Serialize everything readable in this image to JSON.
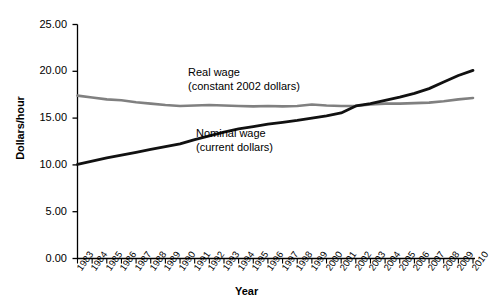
{
  "chart_data": {
    "type": "line",
    "title": "",
    "xlabel": "Year",
    "ylabel": "Dollars/hour",
    "xlim": [
      1983,
      2010
    ],
    "ylim": [
      0,
      25
    ],
    "grid": false,
    "legend_position": "inline-annotations",
    "ytick_labels": [
      "25.00",
      "20.00",
      "15.00",
      "10.00",
      "5.00",
      "0.00"
    ],
    "ytick_values": [
      25,
      20,
      15,
      10,
      5,
      0
    ],
    "x": [
      1983,
      1984,
      1985,
      1986,
      1987,
      1988,
      1989,
      1990,
      1991,
      1992,
      1993,
      1994,
      1995,
      1996,
      1997,
      1998,
      1999,
      2000,
      2001,
      2002,
      2003,
      2004,
      2005,
      2006,
      2007,
      2008,
      2009,
      2010
    ],
    "categories": [
      "1983",
      "1984",
      "1985",
      "1986",
      "1987",
      "1988",
      "1989",
      "1990",
      "1991",
      "1992",
      "1993",
      "1994",
      "1995",
      "1996",
      "1997",
      "1998",
      "1999",
      "2000",
      "2001",
      "2002",
      "2003",
      "2004",
      "2005",
      "2006",
      "2007",
      "2008",
      "2009",
      "2010"
    ],
    "series": [
      {
        "name": "Real wage",
        "sublabel": "(constant 2002 dollars)",
        "color": "#808080",
        "values": [
          17.4,
          17.2,
          17.0,
          16.9,
          16.7,
          16.55,
          16.4,
          16.3,
          16.35,
          16.4,
          16.35,
          16.3,
          16.25,
          16.3,
          16.25,
          16.3,
          16.45,
          16.35,
          16.3,
          16.3,
          16.45,
          16.55,
          16.55,
          16.6,
          16.65,
          16.8,
          17.0,
          17.15
        ]
      },
      {
        "name": "Nominal wage",
        "sublabel": "(current dollars)",
        "color": "#111111",
        "values": [
          10.05,
          10.4,
          10.75,
          11.05,
          11.35,
          11.65,
          11.95,
          12.25,
          12.7,
          13.1,
          13.5,
          13.85,
          14.1,
          14.35,
          14.55,
          14.75,
          15.0,
          15.25,
          15.55,
          16.3,
          16.55,
          16.9,
          17.25,
          17.65,
          18.15,
          18.85,
          19.55,
          20.1
        ]
      }
    ],
    "annotations": [
      {
        "text": "Real wage",
        "sub": "(constant 2002 dollars)"
      },
      {
        "text": "Nominal wage",
        "sub": "(current dollars)"
      }
    ]
  }
}
